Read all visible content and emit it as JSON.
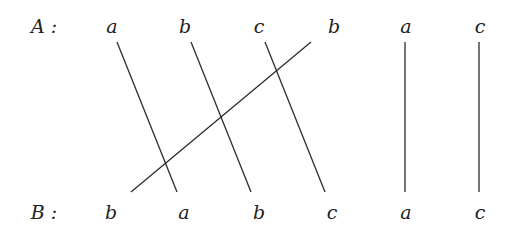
{
  "rows": {
    "top": {
      "label": "A :",
      "label_x": 44,
      "y": 33,
      "nodes": [
        {
          "text": "a",
          "x": 112
        },
        {
          "text": "b",
          "x": 185
        },
        {
          "text": "c",
          "x": 259
        },
        {
          "text": "b",
          "x": 334
        },
        {
          "text": "a",
          "x": 406
        },
        {
          "text": "c",
          "x": 480
        }
      ]
    },
    "bottom": {
      "label": "B :",
      "label_x": 44,
      "y": 219,
      "nodes": [
        {
          "text": "b",
          "x": 111
        },
        {
          "text": "a",
          "x": 184
        },
        {
          "text": "b",
          "x": 259
        },
        {
          "text": "c",
          "x": 332
        },
        {
          "text": "a",
          "x": 406
        },
        {
          "text": "c",
          "x": 480
        }
      ]
    }
  },
  "edges": [
    {
      "from": "A.a(1)",
      "to": "B.a(2)",
      "x1": 117,
      "y1": 42,
      "x2": 177,
      "y2": 192
    },
    {
      "from": "A.b(2)",
      "to": "B.b(3)",
      "x1": 191,
      "y1": 42,
      "x2": 251,
      "y2": 192
    },
    {
      "from": "A.c(3)",
      "to": "B.c(4)",
      "x1": 265,
      "y1": 42,
      "x2": 325,
      "y2": 192
    },
    {
      "from": "A.b(4)",
      "to": "B.b(1)",
      "x1": 311,
      "y1": 42,
      "x2": 131,
      "y2": 192
    },
    {
      "from": "A.a(5)",
      "to": "B.a(5)",
      "x1": 405,
      "y1": 42,
      "x2": 405,
      "y2": 192
    },
    {
      "from": "A.c(6)",
      "to": "B.c(6)",
      "x1": 479,
      "y1": 42,
      "x2": 479,
      "y2": 192
    }
  ],
  "colors": {
    "line": "#2a2a2a",
    "text": "#222222",
    "background": "#ffffff"
  }
}
